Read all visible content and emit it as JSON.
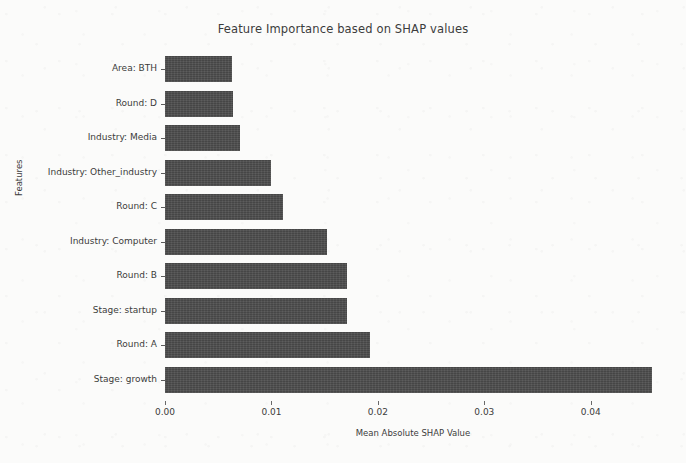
{
  "chart_data": {
    "type": "bar",
    "orientation": "horizontal",
    "title": "Feature Importance based on SHAP values",
    "xlabel": "Mean Absolute SHAP Value",
    "ylabel": "Features",
    "categories": [
      "Area: BTH",
      "Round: D",
      "Industry: Media",
      "Industry: Other_industry",
      "Round: C",
      "Industry: Computer",
      "Round: B",
      "Stage: startup",
      "Round: A",
      "Stage: growth"
    ],
    "values": [
      0.0063,
      0.0064,
      0.007,
      0.01,
      0.0111,
      0.0152,
      0.0171,
      0.0171,
      0.0193,
      0.0458
    ],
    "xticks": [
      0.0,
      0.01,
      0.02,
      0.03,
      0.04
    ],
    "xtick_labels": [
      "0.00",
      "0.01",
      "0.02",
      "0.03",
      "0.04"
    ],
    "xlim": [
      0.0,
      0.0466
    ],
    "grid": false,
    "legend": null,
    "bar_color": "#4d4d4d",
    "background_color": "#fbfbfa"
  }
}
